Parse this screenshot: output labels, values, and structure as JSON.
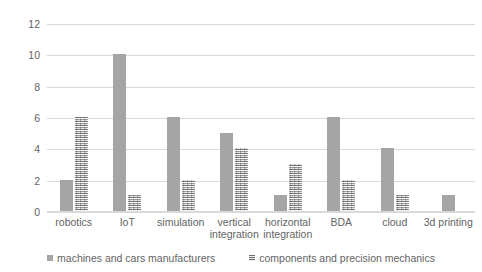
{
  "chart_data": {
    "type": "bar",
    "title": "",
    "subtitle": "",
    "xlabel": "",
    "ylabel": "",
    "ylim": [
      0,
      12
    ],
    "yticks": [
      0,
      2,
      4,
      6,
      8,
      10,
      12
    ],
    "ytick_labels": [
      "0",
      "2",
      "4",
      "6",
      "8",
      "10",
      "12"
    ],
    "grid": true,
    "grid_axis": "y",
    "legend_position": "bottom",
    "categories": [
      "robotics",
      "IoT",
      "simulation",
      "vertical integration",
      "horizontal integration",
      "BDA",
      "cloud",
      "3d printing"
    ],
    "series": [
      {
        "name": "machines and cars manufacturers",
        "color": "#a5a5a5",
        "pattern": "solid",
        "values": [
          2,
          10,
          6,
          5,
          1,
          6,
          4,
          1
        ]
      },
      {
        "name": "components and precision mechanics",
        "color": "#b8b8b8",
        "pattern": "textured",
        "values": [
          6,
          1,
          2,
          4,
          3,
          2,
          1,
          0
        ]
      }
    ]
  },
  "axis": {
    "y_labels": [
      "12",
      "10",
      "8",
      "6",
      "4",
      "2",
      "0"
    ]
  },
  "x_axis": {
    "labels": [
      "robotics",
      "IoT",
      "simulation",
      "vertical integration",
      "horizontal integration",
      "BDA",
      "cloud",
      "3d printing"
    ]
  },
  "legend": {
    "items": [
      {
        "label": "machines and cars manufacturers",
        "marker": "legend-swatch-solid-icon"
      },
      {
        "label": "components and precision mechanics",
        "marker": "legend-swatch-textured-icon"
      }
    ]
  }
}
